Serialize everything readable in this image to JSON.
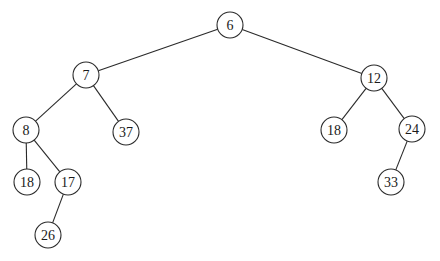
{
  "diagram": {
    "type": "binary-tree",
    "radius": 13,
    "nodes": [
      {
        "id": "n6",
        "label": "6",
        "x": 230,
        "y": 25
      },
      {
        "id": "n7",
        "label": "7",
        "x": 86,
        "y": 75
      },
      {
        "id": "n12",
        "label": "12",
        "x": 374,
        "y": 78
      },
      {
        "id": "n8",
        "label": "8",
        "x": 26,
        "y": 130
      },
      {
        "id": "n37",
        "label": "37",
        "x": 126,
        "y": 132
      },
      {
        "id": "n18r",
        "label": "18",
        "x": 334,
        "y": 130
      },
      {
        "id": "n24",
        "label": "24",
        "x": 412,
        "y": 129
      },
      {
        "id": "n18l",
        "label": "18",
        "x": 27,
        "y": 182
      },
      {
        "id": "n17",
        "label": "17",
        "x": 68,
        "y": 182
      },
      {
        "id": "n33",
        "label": "33",
        "x": 391,
        "y": 182
      },
      {
        "id": "n26",
        "label": "26",
        "x": 48,
        "y": 235
      }
    ],
    "edges": [
      [
        "n6",
        "n7"
      ],
      [
        "n6",
        "n12"
      ],
      [
        "n7",
        "n8"
      ],
      [
        "n7",
        "n37"
      ],
      [
        "n12",
        "n18r"
      ],
      [
        "n12",
        "n24"
      ],
      [
        "n8",
        "n18l"
      ],
      [
        "n8",
        "n17"
      ],
      [
        "n17",
        "n26"
      ],
      [
        "n24",
        "n33"
      ]
    ]
  }
}
